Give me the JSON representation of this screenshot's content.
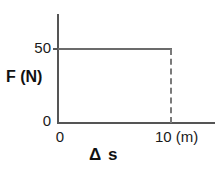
{
  "chart_data": {
    "type": "line",
    "title": "",
    "subtitle": "",
    "xlabel": "Δ s",
    "ylabel": "F (N)",
    "x_unit": "(m)",
    "y_unit": "(N)",
    "xlim": [
      0,
      12.3
    ],
    "ylim": [
      0,
      66
    ],
    "grid": false,
    "legend": null,
    "x": [
      0,
      10
    ],
    "values": [
      50,
      50
    ],
    "series": [
      {
        "name": "Force",
        "x": [
          0,
          10
        ],
        "values": [
          50,
          50
        ],
        "style": "solid",
        "color": "#6b6b6b"
      },
      {
        "name": "drop-to-axis",
        "x": [
          10,
          10
        ],
        "values": [
          50,
          0
        ],
        "style": "dashed",
        "color": "#7a7a7a"
      }
    ],
    "x_ticks": [
      {
        "value": 0,
        "label": "0"
      },
      {
        "value": 10,
        "label": "10 (m)"
      }
    ],
    "y_ticks": [
      {
        "value": 0,
        "label": "0"
      },
      {
        "value": 50,
        "label": "50"
      }
    ],
    "annotations": []
  },
  "axes": {
    "y_title": "F (N)",
    "x_title": "Δ s"
  },
  "ticks": {
    "y_50": "50",
    "y_0": "0",
    "x_0": "0",
    "x_10": "10 (m)"
  },
  "colors": {
    "axis": "#555555",
    "data_line": "#6b6b6b",
    "dashed_line": "#7a7a7a",
    "text": "#1a1a1a",
    "background": "#ffffff"
  }
}
